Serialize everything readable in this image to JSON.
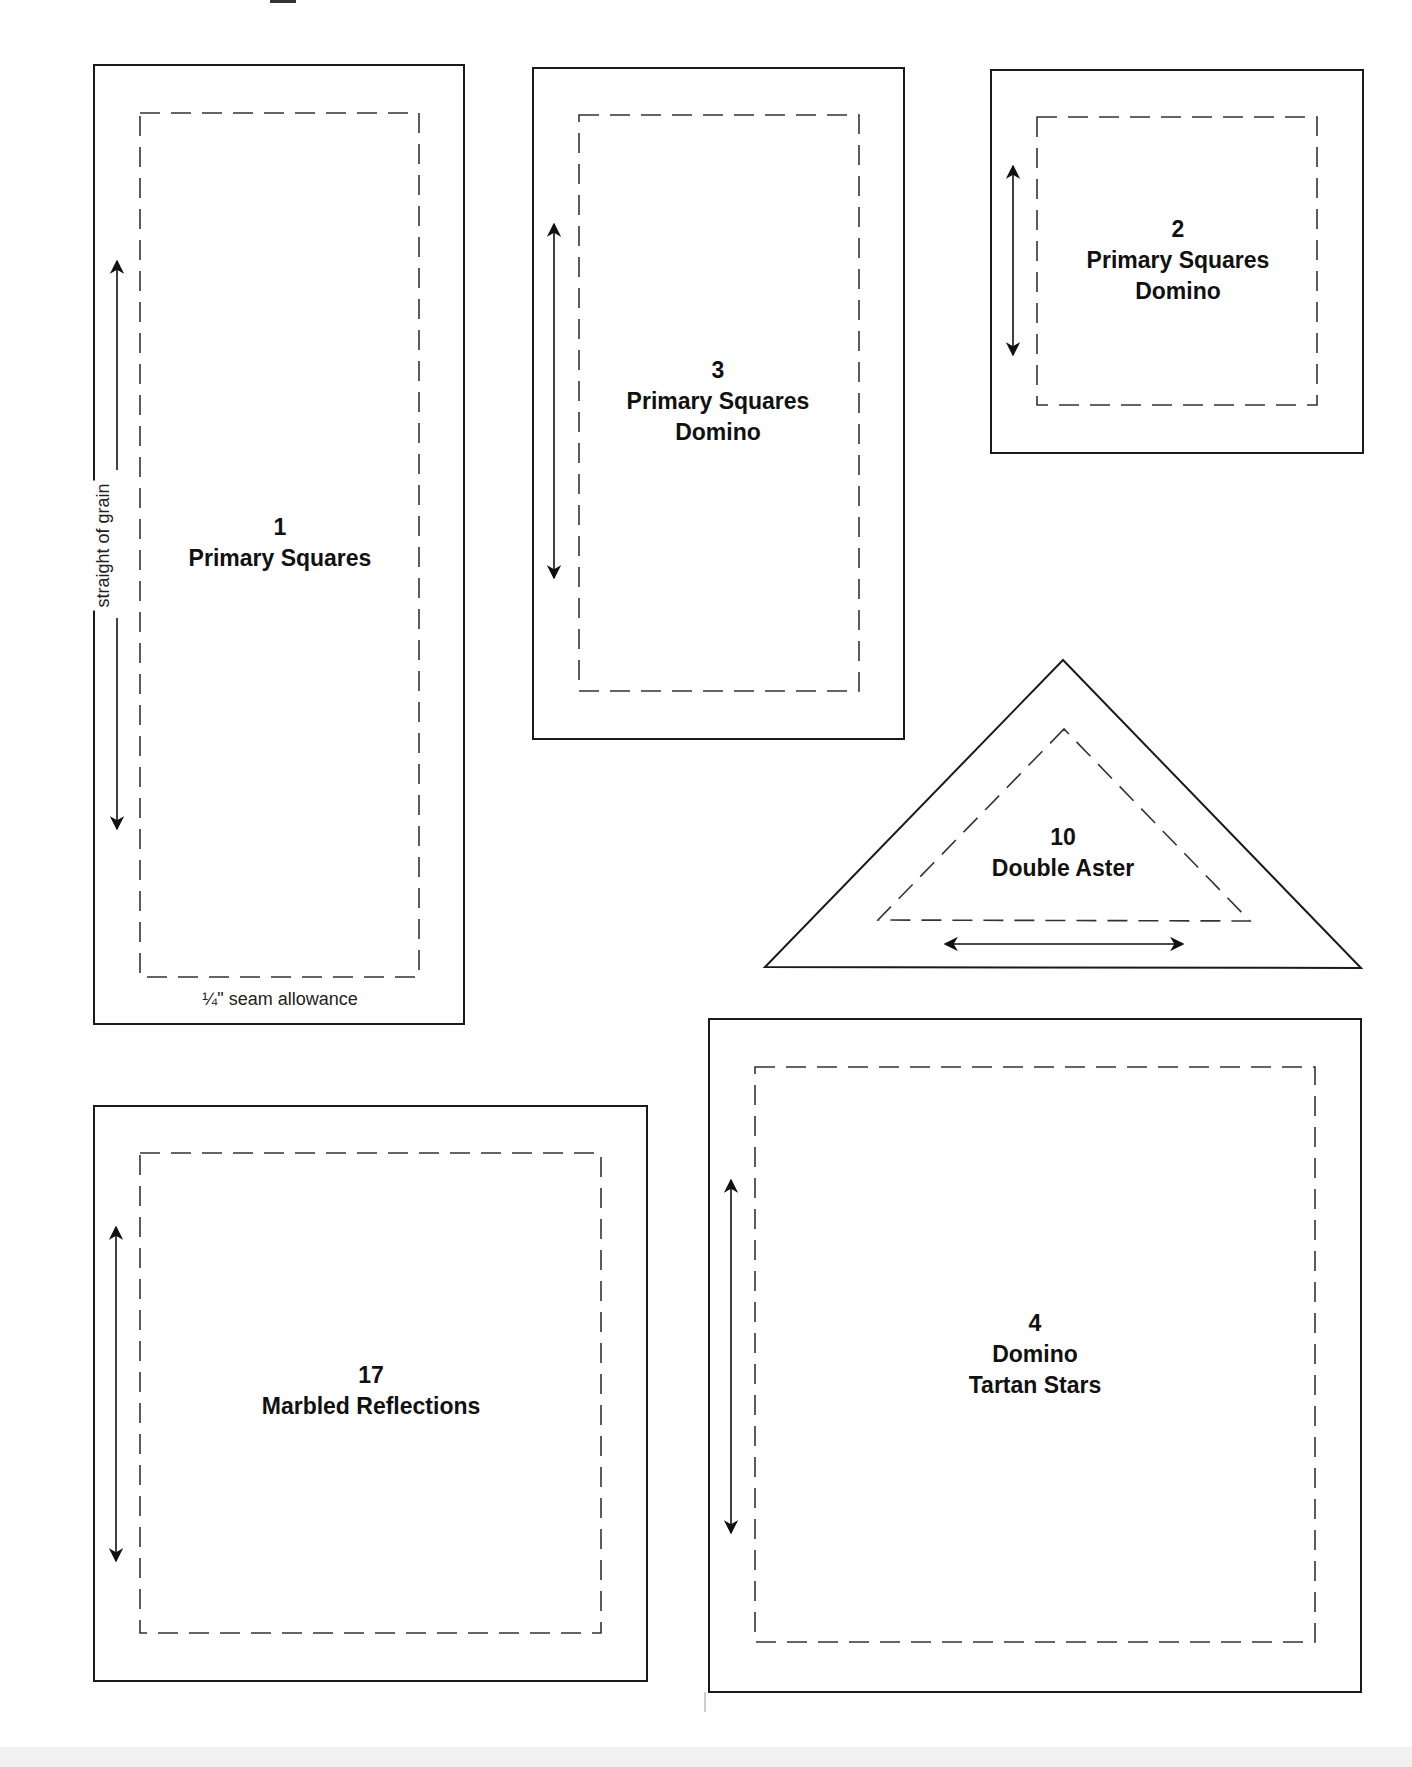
{
  "document": {
    "type": "quilt templates page",
    "seam_allowance_note": "¼\" seam allowance",
    "grain_note": "straight of grain"
  },
  "colors": {
    "outline": "#1a1a1a",
    "seam_dash": "#333333",
    "text": "#111111",
    "paper": "#ffffff"
  },
  "templates": [
    {
      "id": "1",
      "number": "1",
      "names": [
        "Primary Squares"
      ],
      "shape": "rectangle",
      "grain": "vertical"
    },
    {
      "id": "3",
      "number": "3",
      "names": [
        "Primary Squares",
        "Domino"
      ],
      "shape": "rectangle",
      "grain": "vertical"
    },
    {
      "id": "2",
      "number": "2",
      "names": [
        "Primary Squares",
        "Domino"
      ],
      "shape": "square",
      "grain": "vertical"
    },
    {
      "id": "10",
      "number": "10",
      "names": [
        "Double Aster"
      ],
      "shape": "triangle",
      "grain": "horizontal"
    },
    {
      "id": "17",
      "number": "17",
      "names": [
        "Marbled Reflections"
      ],
      "shape": "rectangle",
      "grain": "vertical"
    },
    {
      "id": "4",
      "number": "4",
      "names": [
        "Domino",
        "Tartan Stars"
      ],
      "shape": "square",
      "grain": "vertical"
    }
  ]
}
